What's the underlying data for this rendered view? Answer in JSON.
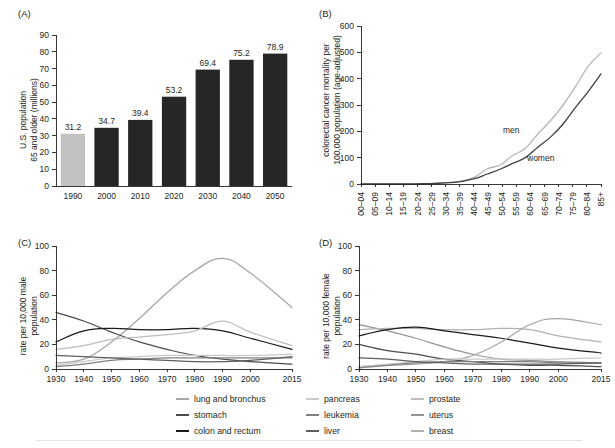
{
  "figure": {
    "panel_labels": {
      "a": "(A)",
      "b": "(B)",
      "c": "(C)",
      "d": "(D)"
    }
  },
  "legend": {
    "columns": [
      {
        "items": [
          {
            "label": "lung and bronchus",
            "color": "#a6a6a6"
          },
          {
            "label": "stomach",
            "color": "#4d4d4d"
          },
          {
            "label": "colon and rectum",
            "color": "#1a1a1a"
          }
        ]
      },
      {
        "items": [
          {
            "label": "pancreas",
            "color": "#c9c9c9"
          },
          {
            "label": "leukemia",
            "color": "#808080"
          },
          {
            "label": "liver",
            "color": "#5e5e5e"
          }
        ]
      },
      {
        "items": [
          {
            "label": "prostate",
            "color": "#bdbdbd"
          },
          {
            "label": "uterus",
            "color": "#949494"
          },
          {
            "label": "breast",
            "color": "#b0b0b0"
          }
        ]
      }
    ]
  },
  "chart_data": [
    {
      "panel": "A",
      "type": "bar",
      "title": "",
      "xlabel": "",
      "ylabel": "U.S. population 65 and older (millions)",
      "ylabel_lines": [
        "U.S. population",
        "65 and older (millions)"
      ],
      "categories": [
        "1990",
        "2000",
        "2010",
        "2020",
        "2030",
        "2040",
        "2050"
      ],
      "values": [
        31.2,
        34.7,
        39.4,
        53.2,
        69.4,
        75.2,
        78.9
      ],
      "data_labels": [
        "31.2",
        "34.7",
        "39.4",
        "53.2",
        "69.4",
        "75.2",
        "78.9"
      ],
      "ylim": [
        0,
        90
      ],
      "yticks": [
        0,
        10,
        20,
        30,
        40,
        50,
        60,
        70,
        80,
        90
      ],
      "ytick_labels": [
        "0",
        "10",
        "20",
        "30",
        "40",
        "50",
        "60",
        "70",
        "80",
        "90"
      ],
      "bar_colors": [
        "#c2c2c2",
        "#262626",
        "#262626",
        "#262626",
        "#262626",
        "#262626",
        "#262626"
      ],
      "grid": false,
      "legend_position": "none"
    },
    {
      "panel": "B",
      "type": "line",
      "title": "",
      "xlabel": "",
      "ylabel": "colorectal cancer mortality per 100,000 population (age-adjusted)",
      "ylabel_lines": [
        "colorectal cancer mortality per",
        "100,000 population (age-adjusted)"
      ],
      "categories": [
        "00–04",
        "05–09",
        "10–14",
        "15–19",
        "20–24",
        "25–29",
        "30–34",
        "35–39",
        "40–44",
        "45–49",
        "50–54",
        "55–59",
        "60–64",
        "65–69",
        "70–74",
        "75–79",
        "80–84",
        "85+"
      ],
      "ylim": [
        0,
        600
      ],
      "yticks": [
        0,
        100,
        200,
        300,
        400,
        500,
        600
      ],
      "ytick_labels": [
        "0",
        "100",
        "200",
        "300",
        "400",
        "500",
        "600"
      ],
      "grid": false,
      "legend_position": "inline-annotation",
      "series": [
        {
          "name": "men",
          "color": "#b5b5b5",
          "annotation": "men",
          "values": [
            0.3,
            0.3,
            0.4,
            0.5,
            0.8,
            1.5,
            3,
            6,
            12,
            26,
            58,
            72,
            108,
            135,
            190,
            240,
            300,
            372,
            448,
            498
          ]
        },
        {
          "name": "women",
          "color": "#3f3f3f",
          "annotation": "women",
          "values": [
            0.3,
            0.3,
            0.4,
            0.5,
            0.7,
            1.2,
            2.5,
            5,
            10,
            20,
            38,
            56,
            78,
            100,
            140,
            178,
            228,
            292,
            352,
            418
          ]
        }
      ],
      "series_values_note": "18 age categories; men/women arrays sampled along curve"
    },
    {
      "panel": "C",
      "type": "line",
      "title": "",
      "xlabel": "",
      "ylabel": "rate per 10,000 male population",
      "ylabel_lines": [
        "rate per 10,000 male",
        "population"
      ],
      "x": [
        1930,
        1940,
        1950,
        1960,
        1970,
        1980,
        1990,
        2000,
        2015
      ],
      "xticks": [
        1930,
        1940,
        1950,
        1960,
        1970,
        1980,
        1990,
        2000,
        2015
      ],
      "xtick_labels": [
        "1930",
        "1940",
        "1950",
        "1960",
        "1970",
        "1980",
        "1990",
        "2000",
        "2015"
      ],
      "ylim": [
        0,
        100
      ],
      "yticks": [
        0,
        20,
        40,
        60,
        80,
        100
      ],
      "ytick_labels": [
        "0",
        "20",
        "40",
        "60",
        "80",
        "100"
      ],
      "grid": false,
      "legend_position": "bottom",
      "series": [
        {
          "name": "lung and bronchus",
          "color": "#a6a6a6",
          "values": [
            5,
            8,
            22,
            41,
            62,
            80,
            90,
            78,
            50
          ]
        },
        {
          "name": "stomach",
          "color": "#4d4d4d",
          "values": [
            46,
            39,
            30,
            22,
            16,
            11,
            8,
            6,
            4
          ]
        },
        {
          "name": "colon and rectum",
          "color": "#1a1a1a",
          "values": [
            22,
            31,
            33,
            32,
            32,
            33,
            31,
            25,
            16
          ]
        },
        {
          "name": "prostate",
          "color": "#bdbdbd",
          "values": [
            16,
            19,
            24,
            26,
            28,
            31,
            39,
            30,
            19
          ]
        },
        {
          "name": "pancreas",
          "color": "#c9c9c9",
          "values": [
            3,
            6,
            9,
            10,
            11,
            11,
            11,
            11,
            12
          ]
        },
        {
          "name": "leukemia",
          "color": "#808080",
          "values": [
            2,
            4,
            7,
            8,
            9,
            9,
            9,
            9,
            9
          ]
        },
        {
          "name": "liver",
          "color": "#5e5e5e",
          "values": [
            11,
            10,
            9,
            8,
            7,
            6,
            6,
            7,
            10
          ]
        }
      ]
    },
    {
      "panel": "D",
      "type": "line",
      "title": "",
      "xlabel": "",
      "ylabel": "rate per 10,000 female population",
      "ylabel_lines": [
        "rate per 10,000 female",
        "population"
      ],
      "x": [
        1930,
        1940,
        1950,
        1960,
        1970,
        1980,
        1990,
        2000,
        2015
      ],
      "xticks": [
        1930,
        1940,
        1950,
        1960,
        1970,
        1980,
        1990,
        2000,
        2015
      ],
      "xtick_labels": [
        "1930",
        "1940",
        "1950",
        "1960",
        "1970",
        "1980",
        "1990",
        "2000",
        "2015"
      ],
      "ylim": [
        0,
        100
      ],
      "yticks": [
        0,
        20,
        40,
        60,
        80,
        100
      ],
      "ytick_labels": [
        "0",
        "20",
        "40",
        "60",
        "80",
        "100"
      ],
      "grid": false,
      "legend_position": "bottom",
      "series": [
        {
          "name": "uterus",
          "color": "#949494",
          "values": [
            36,
            31,
            25,
            18,
            12,
            8,
            7,
            6,
            5
          ]
        },
        {
          "name": "breast",
          "color": "#b0b0b0",
          "values": [
            32,
            33,
            33,
            32,
            32,
            33,
            32,
            27,
            22
          ]
        },
        {
          "name": "colon and rectum",
          "color": "#1a1a1a",
          "values": [
            27,
            32,
            34,
            31,
            28,
            25,
            21,
            17,
            13
          ]
        },
        {
          "name": "stomach",
          "color": "#4d4d4d",
          "values": [
            20,
            15,
            12,
            8,
            6,
            4,
            3,
            3,
            2
          ]
        },
        {
          "name": "lung and bronchus",
          "color": "#a6a6a6",
          "values": [
            2,
            3,
            4,
            6,
            11,
            22,
            36,
            41,
            36
          ]
        },
        {
          "name": "pancreas",
          "color": "#c9c9c9",
          "values": [
            2,
            4,
            6,
            8,
            8,
            8,
            8,
            8,
            9
          ]
        },
        {
          "name": "leukemia",
          "color": "#808080",
          "values": [
            1,
            3,
            5,
            6,
            6,
            6,
            6,
            5,
            5
          ]
        },
        {
          "name": "liver",
          "color": "#5e5e5e",
          "values": [
            9,
            8,
            6,
            5,
            4,
            4,
            4,
            4,
            5
          ]
        }
      ]
    }
  ]
}
